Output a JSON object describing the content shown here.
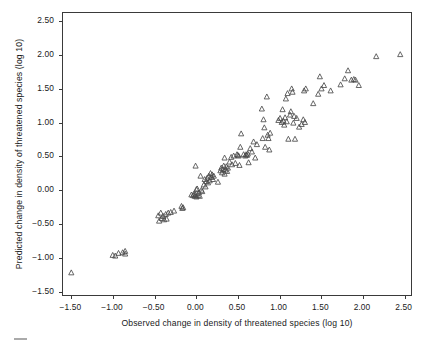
{
  "chart_data": {
    "type": "scatter",
    "title": "",
    "xlabel": "Observed change in density of threatened species (log 10)",
    "ylabel": "Predicted change in density of threatened species (log 10)",
    "xlim": [
      -1.6,
      2.6
    ],
    "ylim": [
      -1.58,
      2.62
    ],
    "xticks": [
      -1.5,
      -1.0,
      -0.5,
      0.0,
      0.5,
      1.0,
      1.5,
      2.0,
      2.5
    ],
    "yticks": [
      -1.5,
      -1.0,
      -0.5,
      0.0,
      0.5,
      1.0,
      1.5,
      2.0,
      2.5
    ],
    "xticklabels": [
      "−1.50",
      "−1.00",
      "−0.50",
      "0.00",
      "0.50",
      "1.00",
      "1.50",
      "2.00",
      "2.50"
    ],
    "yticklabels": [
      "−1.50",
      "−1.00",
      "−0.50",
      "0.00",
      "0.50",
      "1.00",
      "1.50",
      "2.00",
      "2.50"
    ],
    "grid": false,
    "legend": null,
    "marker": "open-triangle",
    "marker_color": "#4a4a4a",
    "marker_size_px": 5.2,
    "series": [
      {
        "name": "observed-vs-predicted",
        "points": [
          [
            -1.5,
            -1.25
          ],
          [
            -1.0,
            -0.99
          ],
          [
            -0.97,
            -1.0
          ],
          [
            -0.93,
            -0.96
          ],
          [
            -0.88,
            -0.95
          ],
          [
            -0.85,
            -0.93
          ],
          [
            -0.85,
            -0.97
          ],
          [
            -0.45,
            -0.4
          ],
          [
            -0.44,
            -0.48
          ],
          [
            -0.42,
            -0.36
          ],
          [
            -0.41,
            -0.44
          ],
          [
            -0.39,
            -0.41
          ],
          [
            -0.38,
            -0.46
          ],
          [
            -0.36,
            -0.38
          ],
          [
            -0.35,
            -0.45
          ],
          [
            -0.33,
            -0.36
          ],
          [
            -0.3,
            -0.35
          ],
          [
            -0.26,
            -0.33
          ],
          [
            -0.17,
            -0.26
          ],
          [
            -0.16,
            -0.29
          ],
          [
            -0.15,
            -0.28
          ],
          [
            -0.05,
            -0.09
          ],
          [
            -0.03,
            -0.1
          ],
          [
            -0.02,
            -0.08
          ],
          [
            -0.01,
            -0.11
          ],
          [
            0.0,
            -0.09
          ],
          [
            0.0,
            0.34
          ],
          [
            0.01,
            -0.01
          ],
          [
            0.01,
            -0.12
          ],
          [
            0.02,
            0.0
          ],
          [
            0.03,
            -0.1
          ],
          [
            0.04,
            -0.06
          ],
          [
            0.05,
            -0.11
          ],
          [
            0.06,
            0.19
          ],
          [
            0.07,
            -0.02
          ],
          [
            0.08,
            -0.04
          ],
          [
            0.1,
            0.06
          ],
          [
            0.11,
            0.14
          ],
          [
            0.12,
            0.03
          ],
          [
            0.13,
            0.11
          ],
          [
            0.14,
            0.16
          ],
          [
            0.15,
            0.09
          ],
          [
            0.16,
            0.19
          ],
          [
            0.17,
            0.12
          ],
          [
            0.18,
            0.23
          ],
          [
            0.19,
            0.17
          ],
          [
            0.2,
            0.21
          ],
          [
            0.21,
            0.14
          ],
          [
            0.22,
            0.19
          ],
          [
            0.27,
            0.1
          ],
          [
            0.3,
            0.27
          ],
          [
            0.31,
            0.31
          ],
          [
            0.32,
            0.24
          ],
          [
            0.33,
            0.29
          ],
          [
            0.34,
            0.34
          ],
          [
            0.35,
            0.22
          ],
          [
            0.35,
            0.46
          ],
          [
            0.36,
            0.28
          ],
          [
            0.37,
            0.33
          ],
          [
            0.38,
            0.26
          ],
          [
            0.39,
            0.31
          ],
          [
            0.41,
            0.4
          ],
          [
            0.43,
            0.47
          ],
          [
            0.44,
            0.36
          ],
          [
            0.46,
            0.49
          ],
          [
            0.48,
            0.38
          ],
          [
            0.5,
            0.51
          ],
          [
            0.51,
            0.5
          ],
          [
            0.52,
            0.49
          ],
          [
            0.53,
            0.35
          ],
          [
            0.54,
            0.62
          ],
          [
            0.55,
            0.82
          ],
          [
            0.58,
            0.51
          ],
          [
            0.6,
            0.49
          ],
          [
            0.61,
            0.51
          ],
          [
            0.62,
            0.5
          ],
          [
            0.63,
            0.52
          ],
          [
            0.64,
            0.39
          ],
          [
            0.66,
            0.6
          ],
          [
            0.68,
            0.55
          ],
          [
            0.7,
            0.7
          ],
          [
            0.72,
            0.46
          ],
          [
            0.74,
            0.66
          ],
          [
            0.8,
            1.19
          ],
          [
            0.81,
            0.75
          ],
          [
            0.82,
            1.03
          ],
          [
            0.83,
            0.91
          ],
          [
            0.84,
            0.62
          ],
          [
            0.86,
            1.37
          ],
          [
            0.87,
            0.8
          ],
          [
            0.88,
            0.75
          ],
          [
            0.89,
            0.58
          ],
          [
            0.9,
            0.83
          ],
          [
            1.0,
            1.02
          ],
          [
            1.02,
            1.05
          ],
          [
            1.04,
            0.99
          ],
          [
            1.05,
            1.18
          ],
          [
            1.06,
            1.01
          ],
          [
            1.07,
            0.95
          ],
          [
            1.08,
            1.06
          ],
          [
            1.09,
            1.34
          ],
          [
            1.1,
            1.0
          ],
          [
            1.11,
            1.42
          ],
          [
            1.12,
            0.74
          ],
          [
            1.14,
            1.1
          ],
          [
            1.15,
            1.15
          ],
          [
            1.16,
            1.49
          ],
          [
            1.17,
            1.44
          ],
          [
            1.18,
            0.98
          ],
          [
            1.19,
            1.08
          ],
          [
            1.2,
            0.74
          ],
          [
            1.22,
            1.05
          ],
          [
            1.25,
            0.92
          ],
          [
            1.28,
            0.96
          ],
          [
            1.3,
            1.03
          ],
          [
            1.31,
            1.46
          ],
          [
            1.32,
            0.99
          ],
          [
            1.33,
            1.49
          ],
          [
            1.42,
            1.27
          ],
          [
            1.48,
            1.41
          ],
          [
            1.5,
            1.67
          ],
          [
            1.52,
            1.49
          ],
          [
            1.55,
            1.54
          ],
          [
            1.63,
            1.46
          ],
          [
            1.75,
            1.55
          ],
          [
            1.8,
            1.64
          ],
          [
            1.84,
            1.76
          ],
          [
            1.88,
            1.62
          ],
          [
            1.91,
            1.63
          ],
          [
            1.93,
            1.62
          ],
          [
            1.97,
            1.54
          ],
          [
            2.18,
            1.97
          ],
          [
            2.47,
            2.0
          ]
        ]
      }
    ]
  },
  "figure": {
    "frame_color": "#3a3a3a",
    "background": "#ffffff"
  }
}
